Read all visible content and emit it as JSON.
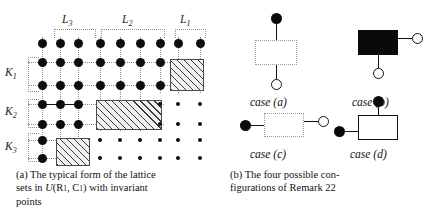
{
  "figure": {
    "panel_a": {
      "caption_line1": "(a) The typical form of the lattice",
      "caption_line2_pre": "sets in ",
      "caption_u": "U",
      "caption_paren_open": "(R",
      "caption_sub1": "1",
      "caption_comma": ", C",
      "caption_sub2": "1",
      "caption_paren_close": ") with invariant",
      "caption_line3": "points",
      "column_group_labels": [
        {
          "name": "L3",
          "text": "L",
          "sub": "3"
        },
        {
          "name": "L2",
          "text": "L",
          "sub": "2"
        },
        {
          "name": "L1",
          "text": "L",
          "sub": "1"
        }
      ],
      "row_group_labels": [
        {
          "name": "K1",
          "text": "K",
          "sub": "1"
        },
        {
          "name": "K2",
          "text": "K",
          "sub": "2"
        },
        {
          "name": "K3",
          "text": "K",
          "sub": "3"
        }
      ],
      "lattice": {
        "columns": 9,
        "rows": 7,
        "big_dots": [
          [
            0,
            0
          ],
          [
            1,
            0
          ],
          [
            2,
            0
          ],
          [
            3,
            0
          ],
          [
            4,
            0
          ],
          [
            5,
            0
          ],
          [
            6,
            0
          ],
          [
            7,
            0
          ],
          [
            8,
            0
          ],
          [
            0,
            1
          ],
          [
            1,
            1
          ],
          [
            2,
            1
          ],
          [
            3,
            1
          ],
          [
            4,
            1
          ],
          [
            5,
            1
          ],
          [
            6,
            1
          ],
          [
            0,
            2
          ],
          [
            1,
            2
          ],
          [
            2,
            2
          ],
          [
            3,
            2
          ],
          [
            4,
            2
          ],
          [
            5,
            2
          ],
          [
            6,
            2
          ],
          [
            0,
            3
          ],
          [
            1,
            3
          ],
          [
            2,
            3
          ],
          [
            0,
            4
          ],
          [
            1,
            4
          ],
          [
            2,
            4
          ],
          [
            0,
            5
          ],
          [
            0,
            6
          ]
        ],
        "small_dots": [
          [
            6,
            3
          ],
          [
            7,
            3
          ],
          [
            8,
            3
          ],
          [
            6,
            4
          ],
          [
            7,
            4
          ],
          [
            8,
            4
          ],
          [
            2,
            5
          ],
          [
            3,
            5
          ],
          [
            4,
            5
          ],
          [
            5,
            5
          ],
          [
            6,
            5
          ],
          [
            7,
            5
          ],
          [
            8,
            5
          ],
          [
            2,
            6
          ],
          [
            3,
            6
          ],
          [
            4,
            6
          ],
          [
            5,
            6
          ],
          [
            6,
            6
          ],
          [
            7,
            6
          ],
          [
            8,
            6
          ]
        ],
        "hatched_blocks": [
          {
            "name": "hatch-K1-L1",
            "col_start": 7,
            "col_end": 8,
            "row_start": 1,
            "row_end": 2
          },
          {
            "name": "hatch-K2-L2",
            "col_start": 3,
            "col_end": 5,
            "row_start": 3,
            "row_end": 4
          },
          {
            "name": "hatch-K3-L3",
            "col_start": 1,
            "col_end": 2,
            "row_start": 5,
            "row_end": 6
          }
        ]
      }
    },
    "panel_b": {
      "caption_line1": "(b) The four possible con-",
      "caption_line2": "figurations of Remark 22",
      "cases": [
        {
          "name": "case-a",
          "label": "case (a)",
          "box_style": "dashed",
          "top_node": "filled",
          "bottom_node": "open",
          "orientation": "vertical"
        },
        {
          "name": "case-b",
          "label": "case (b)",
          "box_style": "black",
          "right_node": "open",
          "bottom_node": "open",
          "orientation": "corner"
        },
        {
          "name": "case-c",
          "label": "case (c)",
          "box_style": "dashed",
          "left_node": "filled",
          "right_node": "open",
          "orientation": "horizontal"
        },
        {
          "name": "case-d",
          "label": "case (d)",
          "box_style": "white",
          "left_node": "filled",
          "top_node": "filled",
          "orientation": "corner"
        }
      ]
    }
  },
  "colors": {
    "ink": "#0d0d0d",
    "guide": "#8e8e8e",
    "hatch": "#3a3a3a",
    "paper": "#ffffff"
  }
}
